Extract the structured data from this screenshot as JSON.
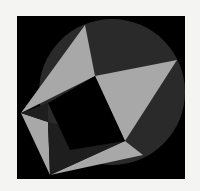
{
  "figure": {
    "colors": {
      "page": "#f4f4f2",
      "frame": "#000000",
      "circle": "#2a2a2a",
      "light": "#a8a8a8",
      "dark_tri": "#1e1e1e"
    },
    "frame": {
      "x": 17,
      "y": 16,
      "w": 168,
      "h": 163
    },
    "circle": {
      "cx": 112,
      "cy": 92,
      "r": 73
    },
    "vertices": {
      "top": [
        85,
        25
      ],
      "center": [
        95,
        76
      ],
      "right": [
        177,
        60
      ],
      "inner_br": [
        125,
        141
      ],
      "left": [
        21,
        113
      ],
      "inner_left": [
        48,
        122
      ],
      "bottom": [
        50,
        175
      ],
      "bottom_right": [
        143,
        155
      ]
    }
  }
}
